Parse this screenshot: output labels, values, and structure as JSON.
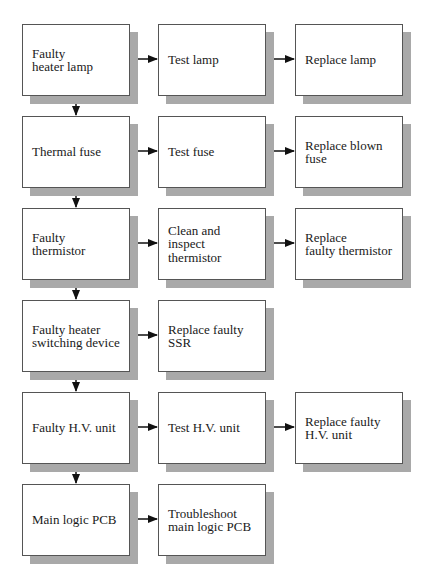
{
  "diagram": {
    "type": "troubleshooting-flowchart",
    "rows": [
      {
        "fault": "Faulty\nheater lamp",
        "steps": [
          "Test lamp",
          "Replace lamp"
        ]
      },
      {
        "fault": "Thermal fuse",
        "steps": [
          "Test fuse",
          "Replace blown\nfuse"
        ]
      },
      {
        "fault": "Faulty\nthermistor",
        "steps": [
          "Clean and\ninspect\nthermistor",
          "Replace\nfaulty thermistor"
        ]
      },
      {
        "fault": "Faulty heater\nswitching device",
        "steps": [
          "Replace faulty\nSSR"
        ]
      },
      {
        "fault": "Faulty H.V. unit",
        "steps": [
          "Test H.V. unit",
          "Replace faulty\nH.V. unit"
        ]
      },
      {
        "fault": "Main logic PCB",
        "steps": [
          "Troubleshoot\nmain logic PCB"
        ]
      }
    ],
    "colors": {
      "box_fill": "#ffffff",
      "box_border": "#555555",
      "shadow": "#a9a9a9",
      "arrow": "#111111"
    }
  }
}
